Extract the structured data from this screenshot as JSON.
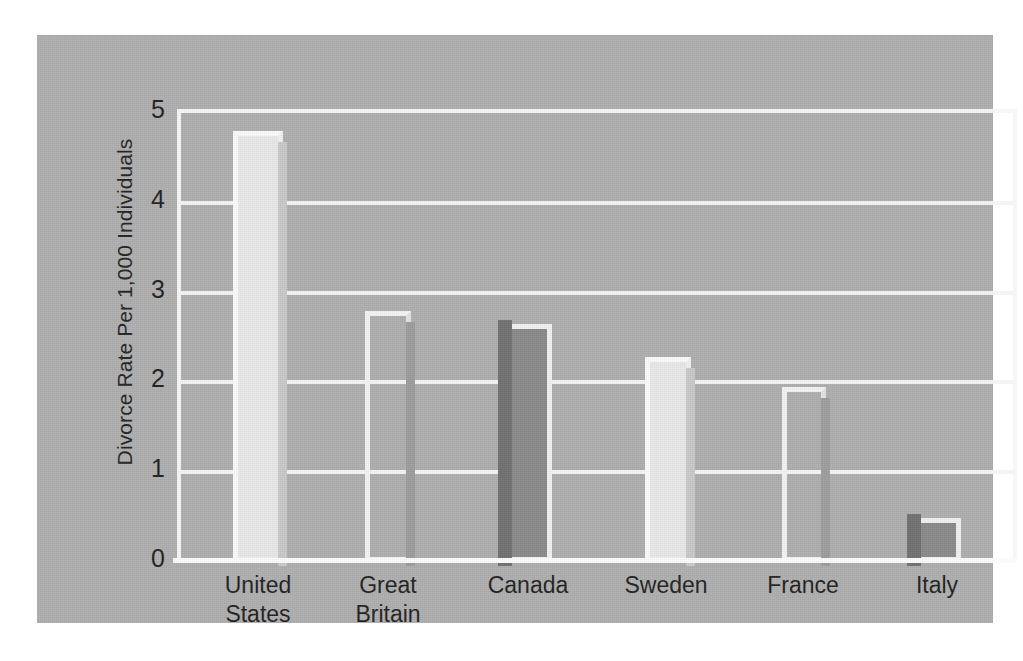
{
  "chart_data": {
    "type": "bar",
    "title": "",
    "xlabel": "",
    "ylabel": "Divorce Rate Per 1,000 Individuals",
    "categories": [
      "United States",
      "Great Britain",
      "Canada",
      "Sweden",
      "France",
      "Italy"
    ],
    "category_lines": [
      [
        "United",
        "States"
      ],
      [
        "Great",
        "Britain"
      ],
      [
        "Canada"
      ],
      [
        "Sweden"
      ],
      [
        "France"
      ],
      [
        "Italy"
      ]
    ],
    "values": [
      4.8,
      2.8,
      2.65,
      2.28,
      1.95,
      0.49
    ],
    "ylim": [
      0,
      5
    ],
    "yticks": [
      0,
      1,
      2,
      3,
      4,
      5
    ],
    "ytick_labels": [
      "0",
      "1",
      "2",
      "3",
      "4",
      "5"
    ],
    "grid": true,
    "grid_color": "#f4f4f4",
    "legend": "none",
    "bar_styles": [
      "light",
      "hollow",
      "dark",
      "light",
      "hollow",
      "dark"
    ]
  },
  "figure": {
    "panel_color": "#adadad",
    "page_background": "#ffffff",
    "axis_color": "#f6f6f6",
    "text_color": "#1f1f1f"
  }
}
